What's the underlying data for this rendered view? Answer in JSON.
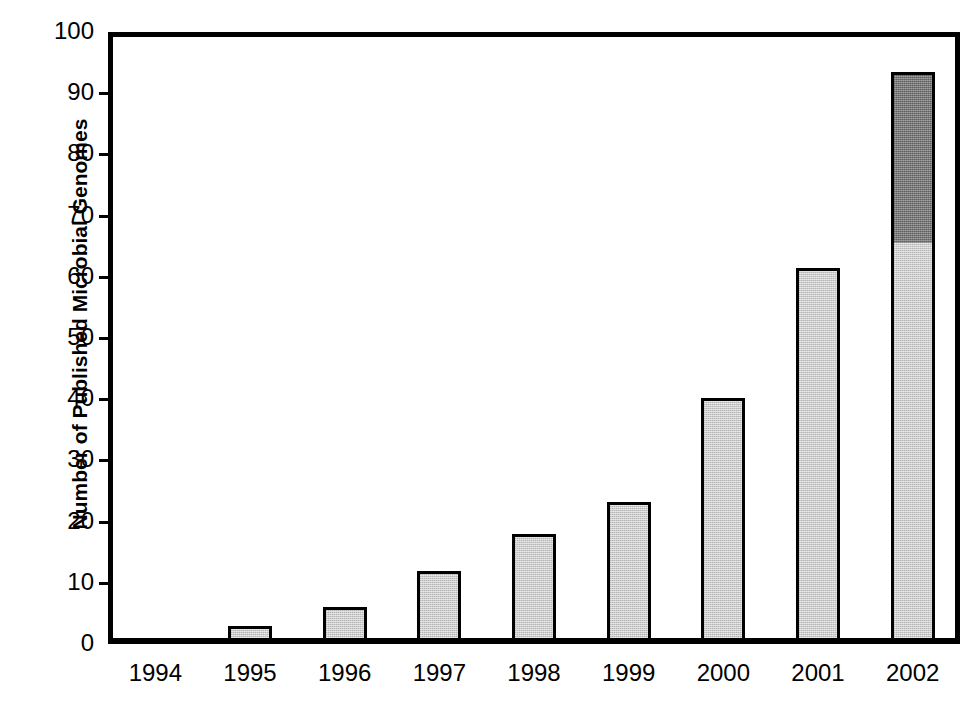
{
  "chart_data": {
    "type": "bar",
    "title": "",
    "xlabel": "",
    "ylabel": "Number of Published Microbial Genomes",
    "categories": [
      "1994",
      "1995",
      "1996",
      "1997",
      "1998",
      "1999",
      "2000",
      "2001",
      "2002"
    ],
    "ylim": [
      0,
      100
    ],
    "ytick_labels": [
      "0",
      "10",
      "20",
      "30",
      "40",
      "50",
      "60",
      "70",
      "80",
      "90",
      "100"
    ],
    "ytick_values": [
      0,
      10,
      20,
      30,
      40,
      50,
      60,
      70,
      80,
      90,
      100
    ],
    "grid": false,
    "legend": "none",
    "stacked": true,
    "series": [
      {
        "name": "published",
        "fill": "#cdcdcd",
        "values": [
          0,
          2,
          5,
          11,
          17,
          22.2,
          39.2,
          60.4,
          64.5
        ]
      },
      {
        "name": "projected-additional",
        "fill": "#787878",
        "values": [
          0,
          0,
          0,
          0,
          0,
          0,
          0,
          0,
          28.0
        ]
      }
    ],
    "totals": [
      0,
      2,
      5,
      11,
      17,
      22.2,
      39.2,
      60.4,
      92.5
    ]
  },
  "colors": {
    "axis": "#000000",
    "bar_light": "#cdcdcd",
    "bar_dark": "#787878",
    "background": "#ffffff"
  }
}
